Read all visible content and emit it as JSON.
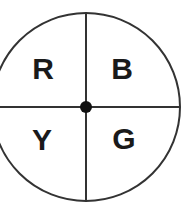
{
  "diagram": {
    "type": "spinner",
    "center": {
      "x": 86,
      "y": 107
    },
    "radius": 94,
    "stroke_color": "#333333",
    "stroke_width": 2,
    "center_dot": {
      "radius": 6,
      "color": "#111111"
    },
    "sections": [
      {
        "id": "top-left",
        "label": "R",
        "x": 43,
        "y": 79
      },
      {
        "id": "top-right",
        "label": "B",
        "x": 122,
        "y": 79
      },
      {
        "id": "bottom-left",
        "label": "Y",
        "x": 42,
        "y": 150
      },
      {
        "id": "bottom-right",
        "label": "G",
        "x": 124,
        "y": 149
      }
    ]
  }
}
